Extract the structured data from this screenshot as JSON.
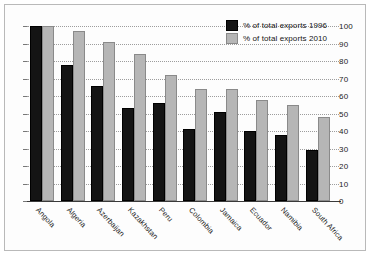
{
  "chart_data": {
    "type": "bar",
    "title": "",
    "xlabel": "",
    "ylabel": "",
    "ylim": [
      0,
      100
    ],
    "yticks": [
      0,
      10,
      20,
      30,
      40,
      50,
      60,
      70,
      80,
      90,
      100
    ],
    "grid": true,
    "legend_position": "top-right",
    "categories": [
      "Angola",
      "Algeria",
      "Azerbaijan",
      "Kazakhstan",
      "Peru",
      "Colombia",
      "Jamaica",
      "Ecuador",
      "Namibia",
      "South Africa"
    ],
    "series": [
      {
        "name": "% of total exports 1996",
        "color": "#141414",
        "values": [
          100,
          78,
          66,
          53,
          56,
          41,
          51,
          40,
          38,
          29
        ]
      },
      {
        "name": "% of total exports 2010",
        "color": "#b6b6b6",
        "values": [
          100,
          97,
          91,
          84,
          72,
          64,
          64,
          58,
          55,
          48
        ]
      }
    ]
  },
  "legend": {
    "items": [
      {
        "label": "% of total exports 1996"
      },
      {
        "label": "% of total exports 2010"
      }
    ]
  }
}
